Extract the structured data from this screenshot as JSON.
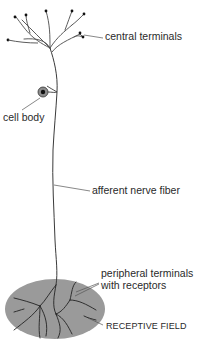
{
  "figure": {
    "labels": {
      "central_terminals": "central terminals",
      "cell_body": "cell body",
      "afferent_nerve_fiber": "afferent nerve fiber",
      "peripheral_terminals_line1": "peripheral terminals",
      "peripheral_terminals_line2": "with receptors",
      "receptive_field": "RECEPTIVE FIELD"
    },
    "colors": {
      "line": "#3a3a3a",
      "receptive_field_fill": "#9a9a9a",
      "cell_body_fill": "#8c8c8c",
      "nucleus": "#111111",
      "text": "#2a2a2a"
    }
  }
}
